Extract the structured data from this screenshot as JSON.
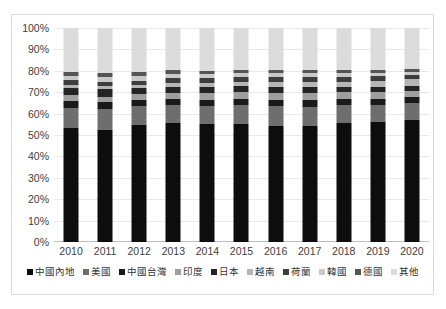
{
  "chart_data": {
    "type": "bar",
    "subtype": "stacked-100-percent",
    "title": "",
    "xlabel": "",
    "ylabel": "",
    "ylim": [
      0,
      100
    ],
    "ytick_labels": [
      "100%",
      "90%",
      "80%",
      "70%",
      "60%",
      "50%",
      "40%",
      "30%",
      "20%",
      "10%",
      "0%"
    ],
    "ytick_values": [
      100,
      90,
      80,
      70,
      60,
      50,
      40,
      30,
      20,
      10,
      0
    ],
    "grid": true,
    "legend_position": "bottom",
    "categories": [
      "2010",
      "2011",
      "2012",
      "2013",
      "2014",
      "2015",
      "2016",
      "2017",
      "2018",
      "2019",
      "2020"
    ],
    "series": [
      {
        "name": "中國內地",
        "color": "#0d0d0d",
        "values": [
          53.5,
          52.5,
          54.5,
          55.5,
          55.0,
          55.0,
          54.0,
          54.0,
          55.5,
          56.0,
          57.0
        ]
      },
      {
        "name": "美國",
        "color": "#6e6e6e",
        "values": [
          9.0,
          9.5,
          9.0,
          8.5,
          8.5,
          9.0,
          9.5,
          9.0,
          8.5,
          8.0,
          8.0
        ]
      },
      {
        "name": "中國台灣",
        "color": "#1a1a1a",
        "values": [
          3.5,
          3.5,
          3.0,
          3.0,
          3.0,
          3.0,
          3.0,
          3.5,
          3.0,
          3.0,
          3.0
        ]
      },
      {
        "name": "印度",
        "color": "#9e9e9e",
        "values": [
          2.5,
          2.5,
          2.5,
          2.5,
          3.0,
          3.0,
          3.0,
          3.0,
          3.0,
          3.0,
          2.5
        ]
      },
      {
        "name": "日本",
        "color": "#242424",
        "values": [
          3.5,
          3.5,
          3.0,
          3.0,
          3.0,
          3.0,
          3.0,
          3.0,
          2.5,
          2.5,
          2.5
        ]
      },
      {
        "name": "越南",
        "color": "#b5b5b5",
        "values": [
          1.5,
          1.5,
          1.5,
          2.0,
          2.0,
          2.0,
          2.5,
          2.5,
          2.5,
          3.0,
          3.0
        ]
      },
      {
        "name": "荷蘭",
        "color": "#3d3d3d",
        "values": [
          2.0,
          2.0,
          2.0,
          2.0,
          2.0,
          2.0,
          2.0,
          2.0,
          2.0,
          2.0,
          2.0
        ]
      },
      {
        "name": "韓國",
        "color": "#c9c9c9",
        "values": [
          2.0,
          2.0,
          2.0,
          2.0,
          2.0,
          2.0,
          2.0,
          2.0,
          2.0,
          1.5,
          1.5
        ]
      },
      {
        "name": "德國",
        "color": "#555555",
        "values": [
          2.0,
          2.0,
          2.0,
          2.0,
          1.5,
          1.5,
          1.5,
          1.5,
          1.5,
          1.5,
          1.5
        ]
      },
      {
        "name": "其他",
        "color": "#dcdcdc",
        "values": [
          20.5,
          21.0,
          20.5,
          19.5,
          20.0,
          19.5,
          19.5,
          19.5,
          19.5,
          19.5,
          19.0
        ]
      }
    ]
  }
}
